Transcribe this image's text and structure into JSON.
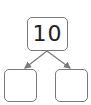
{
  "diagram": {
    "type": "number-bond",
    "whole": {
      "value": "10"
    },
    "parts": [
      {
        "value": ""
      },
      {
        "value": ""
      }
    ],
    "colors": {
      "stroke": "#7a7a7a",
      "text": "#222222",
      "background": "#ffffff"
    }
  }
}
